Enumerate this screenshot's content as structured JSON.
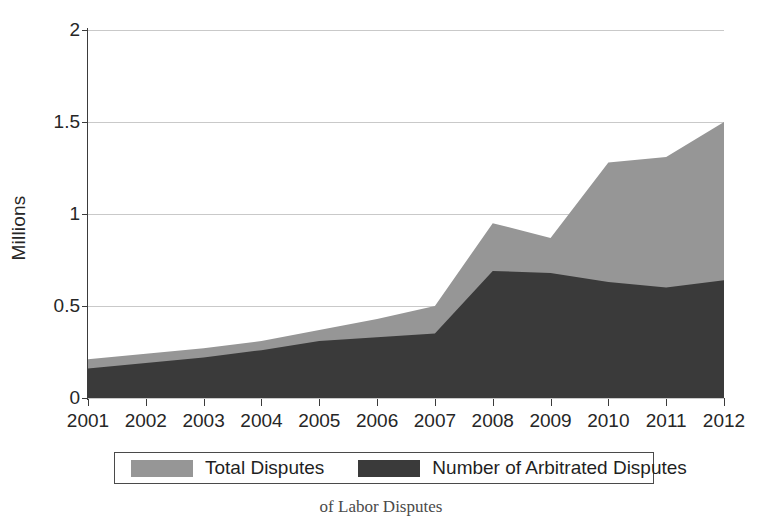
{
  "chart_data": {
    "type": "area",
    "stacked": true,
    "title": "",
    "subtitle": "",
    "xlabel": "",
    "ylabel": "Millions",
    "categories": [
      "2001",
      "2002",
      "2003",
      "2004",
      "2005",
      "2006",
      "2007",
      "2008",
      "2009",
      "2010",
      "2011",
      "2012"
    ],
    "x": [
      2001,
      2002,
      2003,
      2004,
      2005,
      2006,
      2007,
      2008,
      2009,
      2010,
      2011,
      2012
    ],
    "series": [
      {
        "name": "Total Disputes",
        "color": "#969696",
        "values": [
          0.21,
          0.24,
          0.27,
          0.31,
          0.37,
          0.43,
          0.5,
          0.95,
          0.87,
          1.28,
          1.31,
          1.5
        ]
      },
      {
        "name": "Number of Arbitrated Disputes",
        "color": "#3a3a3a",
        "values": [
          0.16,
          0.19,
          0.22,
          0.26,
          0.31,
          0.33,
          0.35,
          0.69,
          0.68,
          0.63,
          0.6,
          0.64
        ]
      }
    ],
    "ylim": [
      0,
      2
    ],
    "yticks": [
      0,
      0.5,
      1,
      1.5,
      2
    ],
    "ytick_labels": [
      "0",
      "0.5",
      "1",
      "1.5",
      "2"
    ],
    "xlim": [
      2001,
      2012
    ],
    "grid": true,
    "grid_axis": "y",
    "legend_position": "bottom"
  },
  "axis": {
    "y_title": "Millions",
    "y_tick_labels": [
      "0",
      "0.5",
      "1",
      "1.5",
      "2"
    ],
    "x_tick_labels": [
      "2001",
      "2002",
      "2003",
      "2004",
      "2005",
      "2006",
      "2007",
      "2008",
      "2009",
      "2010",
      "2011",
      "2012"
    ]
  },
  "legend": {
    "entries": [
      {
        "label": "Total Disputes",
        "color": "#969696"
      },
      {
        "label": "Number of Arbitrated Disputes",
        "color": "#3a3a3a"
      }
    ]
  },
  "caption": {
    "text": "of Labor Disputes"
  },
  "colors": {
    "total_disputes": "#969696",
    "arbitrated_disputes": "#3a3a3a",
    "axis": "#3b3b3b",
    "grid": "#c9c9c9",
    "background": "#ffffff"
  }
}
